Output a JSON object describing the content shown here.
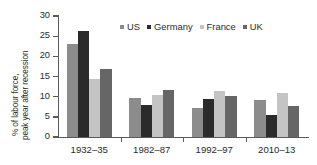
{
  "chart_data": {
    "type": "bar",
    "title": "",
    "subtitle": "",
    "xlabel": "",
    "ylabel_line1": "% of labour force,",
    "ylabel_line2": "peak year after recession",
    "categories": [
      "1932–35",
      "1982–87",
      "1992–97",
      "2010–13"
    ],
    "series": [
      {
        "name": "US",
        "color": "#8c8c8c",
        "values": [
          23.0,
          9.6,
          7.3,
          9.1
        ]
      },
      {
        "name": "Germany",
        "color": "#2b2b2b",
        "values": [
          26.3,
          8.0,
          9.5,
          5.4
        ]
      },
      {
        "name": "France",
        "color": "#c4c4c4",
        "values": [
          14.4,
          10.4,
          11.4,
          10.8
        ]
      },
      {
        "name": "UK",
        "color": "#666666",
        "values": [
          16.9,
          11.6,
          10.2,
          7.8
        ]
      }
    ],
    "ylim": [
      0,
      30
    ],
    "ytick_values": [
      0,
      5,
      10,
      15,
      20,
      25,
      30
    ],
    "ytick_labels": [
      "0",
      "5",
      "10",
      "15",
      "20",
      "25",
      "30"
    ],
    "grid": false,
    "legend_position": "top-right",
    "axis_color": "#5a5a5a",
    "text_color": "#2b2b2b",
    "background": "#ffffff"
  }
}
